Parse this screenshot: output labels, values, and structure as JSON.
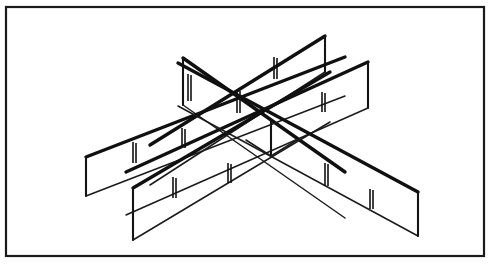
{
  "figure": {
    "title": "Cross-shaped partition assembly isometric line drawing",
    "drawing_style": "black-and-white technical line art",
    "background_color": "#ffffff",
    "line_color": "#101010",
    "border": {
      "name": "outer-frame",
      "stroke_color": "#1a1a1a",
      "stroke_width": 2.2,
      "x": 6,
      "y": 7,
      "width": 478,
      "height": 249
    },
    "center_post": {
      "name": "central-vertical-post",
      "top_x": 271,
      "top_y": 121,
      "bottom_x": 271,
      "bottom_y": 156
    },
    "panels": [
      {
        "id": "panel-upper-left",
        "label": "Upper left panel",
        "direction": "up-left",
        "far_end_x": 183,
        "far_end_top_y": 58,
        "far_end_bottom_y": 105,
        "slot_count": 1
      },
      {
        "id": "panel-upper-right",
        "label": "Upper right panel",
        "direction": "up-right",
        "far_end_x": 325,
        "far_end_top_y": 36,
        "far_end_bottom_y": 72,
        "slot_count": 1
      },
      {
        "id": "panel-lower-left",
        "label": "Lower left panel",
        "direction": "down-left",
        "far_end_x": 86,
        "far_end_top_y": 157,
        "far_end_bottom_y": 196,
        "slot_count": 2
      },
      {
        "id": "panel-lower-right",
        "label": "Lower right panel",
        "direction": "down-right",
        "far_end_x": 368,
        "far_end_top_y": 62,
        "far_end_bottom_y": 108,
        "slot_count": 2
      },
      {
        "id": "panel-front-left",
        "label": "Front left panel",
        "direction": "front-left",
        "far_end_x": 133,
        "far_end_top_y": 188,
        "far_end_bottom_y": 240,
        "slot_count": 2
      },
      {
        "id": "panel-front-right",
        "label": "Front right panel",
        "direction": "front-right",
        "far_end_x": 418,
        "far_end_top_y": 192,
        "far_end_bottom_y": 236,
        "slot_count": 2
      }
    ],
    "slots": [
      {
        "id": "slot-1",
        "x": 274,
        "y_top": 57,
        "y_bottom": 79
      },
      {
        "id": "slot-2",
        "x": 322,
        "y_top": 92,
        "y_bottom": 106
      },
      {
        "id": "slot-3",
        "x": 325,
        "y_top": 163,
        "y_bottom": 186
      },
      {
        "id": "slot-4",
        "x": 370,
        "y_top": 189,
        "y_bottom": 208
      },
      {
        "id": "slot-5",
        "x": 133,
        "y_top": 142,
        "y_bottom": 163
      },
      {
        "id": "slot-6",
        "x": 182,
        "y_top": 128,
        "y_bottom": 148
      },
      {
        "id": "slot-7",
        "x": 173,
        "y_top": 177,
        "y_bottom": 198
      },
      {
        "id": "slot-8",
        "x": 228,
        "y_top": 163,
        "y_bottom": 182
      },
      {
        "id": "slot-9",
        "x": 188,
        "y_top": 70,
        "y_bottom": 100
      },
      {
        "id": "slot-10",
        "x": 237,
        "y_top": 88,
        "y_bottom": 112
      }
    ]
  }
}
